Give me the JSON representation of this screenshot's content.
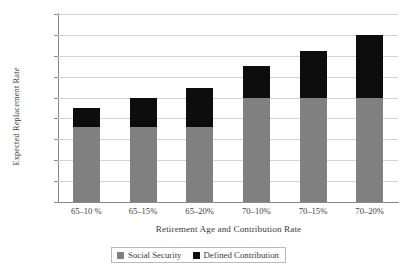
{
  "chart_data": {
    "type": "bar",
    "subtype": "stacked-vertical",
    "title": "",
    "xlabel": "Retirement Age and Contribution Rate",
    "ylabel": "Expected Replacement Rate",
    "categories": [
      "65–10 %",
      "65–15%",
      "65–20%",
      "70–10%",
      "70–15%",
      "70–20%"
    ],
    "series": [
      {
        "name": "Social Security",
        "color": "#808080",
        "values": [
          36,
          36,
          36,
          50,
          50,
          50
        ]
      },
      {
        "name": "Defined Contribution",
        "color": "#0d0d0d",
        "values": [
          9,
          14,
          18.5,
          15,
          22.5,
          30
        ]
      }
    ],
    "totals": [
      45,
      50,
      54.5,
      65,
      72.5,
      80
    ],
    "ylim": [
      0,
      90
    ],
    "ytick_values": [
      0,
      10,
      20,
      30,
      40,
      50,
      60,
      70,
      80,
      90
    ],
    "ytick_labels": [
      "0%",
      "10%",
      "20%",
      "30%",
      "40%",
      "50%",
      "60%",
      "70%",
      "80%",
      "90%"
    ],
    "grid": true,
    "grid_axis": "y",
    "legend_position": "bottom",
    "legend_entries": [
      "Social Security",
      "Defined Contribution"
    ],
    "colors": {
      "social_security": "#808080",
      "defined_contribution": "#0d0d0d",
      "gridline": "#d2d2d2",
      "axis": "#8a8a8a",
      "text": "#3c3c3c",
      "background": "#ffffff"
    }
  }
}
